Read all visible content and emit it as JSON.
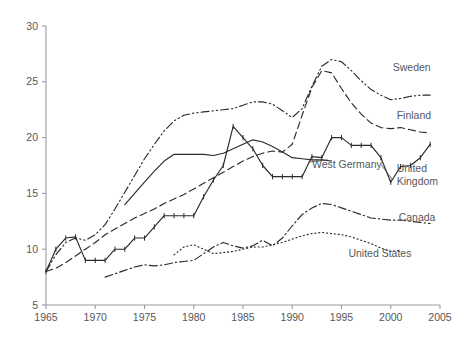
{
  "chart_data": {
    "type": "line",
    "title": "",
    "subtitle": "",
    "xlabel": "",
    "ylabel": "",
    "xlim": [
      1965,
      2005
    ],
    "ylim": [
      5,
      30
    ],
    "xticks": [
      1965,
      1970,
      1975,
      1980,
      1985,
      1990,
      1995,
      2000,
      2005
    ],
    "yticks": [
      5,
      10,
      15,
      20,
      25,
      30
    ],
    "grid": false,
    "legend": "inline-labels",
    "series": [
      {
        "name": "Sweden",
        "style": "dash-dot-dot",
        "marker": "none",
        "label_x": 2000.2,
        "label_y": 26.3,
        "x": [
          1965,
          1966,
          1967,
          1968,
          1969,
          1970,
          1971,
          1972,
          1973,
          1974,
          1975,
          1976,
          1977,
          1978,
          1979,
          1980,
          1981,
          1982,
          1983,
          1984,
          1985,
          1986,
          1987,
          1988,
          1989,
          1990,
          1991,
          1992,
          1993,
          1994,
          1995,
          1996,
          1997,
          1998,
          1999,
          2000,
          2001,
          2002,
          2003,
          2004
        ],
        "y": [
          8.0,
          9.5,
          10.6,
          11.0,
          10.8,
          11.3,
          12.2,
          13.6,
          15.1,
          16.6,
          18.1,
          19.4,
          20.6,
          21.5,
          22.0,
          22.2,
          22.3,
          22.4,
          22.5,
          22.6,
          22.9,
          23.2,
          23.2,
          23.0,
          22.4,
          21.8,
          22.6,
          24.6,
          26.4,
          27.0,
          26.8,
          26.0,
          25.1,
          24.3,
          23.8,
          23.4,
          23.5,
          23.7,
          23.8,
          23.8
        ]
      },
      {
        "name": "Finland",
        "style": "dashed",
        "marker": "none",
        "label_x": 2000.6,
        "label_y": 22.0,
        "x": [
          1965,
          1966,
          1967,
          1968,
          1969,
          1970,
          1971,
          1972,
          1973,
          1974,
          1975,
          1976,
          1977,
          1978,
          1979,
          1980,
          1981,
          1982,
          1983,
          1984,
          1985,
          1986,
          1987,
          1988,
          1989,
          1990,
          1991,
          1992,
          1993,
          1994,
          1995,
          1996,
          1997,
          1998,
          1999,
          2000,
          2001,
          2002,
          2003,
          2004
        ],
        "y": [
          8.0,
          8.3,
          8.8,
          9.4,
          10.0,
          10.6,
          11.3,
          11.8,
          12.3,
          12.8,
          13.2,
          13.6,
          14.1,
          14.5,
          14.9,
          15.4,
          15.9,
          16.4,
          16.9,
          17.4,
          17.9,
          18.3,
          18.6,
          18.8,
          18.7,
          19.4,
          22.0,
          24.5,
          26.0,
          25.8,
          24.4,
          23.1,
          22.1,
          21.3,
          20.9,
          20.8,
          20.9,
          20.7,
          20.5,
          20.4
        ]
      },
      {
        "name": "West Germany",
        "style": "solid",
        "marker": "none",
        "label_x": 1992.0,
        "label_y": 17.6,
        "x": [
          1973,
          1974,
          1975,
          1976,
          1977,
          1978,
          1979,
          1980,
          1981,
          1982,
          1983,
          1984,
          1985,
          1986,
          1987,
          1988,
          1989,
          1990,
          1991,
          1992,
          1993,
          1994
        ],
        "y": [
          14.0,
          15.0,
          16.0,
          17.0,
          17.9,
          18.5,
          18.5,
          18.5,
          18.5,
          18.4,
          18.6,
          19.0,
          19.4,
          19.8,
          19.6,
          19.2,
          18.7,
          18.2,
          18.1,
          18.0,
          18.0,
          17.9
        ]
      },
      {
        "name": "United Kingdom",
        "style": "solid-ticks",
        "marker": "tick",
        "label_x": 2000.6,
        "label_y": 17.3,
        "x": [
          1965,
          1966,
          1967,
          1968,
          1969,
          1970,
          1971,
          1972,
          1973,
          1974,
          1975,
          1976,
          1977,
          1978,
          1979,
          1980,
          1981,
          1982,
          1983,
          1984,
          1985,
          1986,
          1987,
          1988,
          1989,
          1990,
          1991,
          1992,
          1993,
          1994,
          1995,
          1996,
          1997,
          1998,
          1999,
          2000,
          2001,
          2002,
          2003,
          2004
        ],
        "y": [
          8.0,
          10.0,
          11.0,
          11.1,
          9.0,
          9.0,
          9.0,
          10.0,
          10.0,
          11.0,
          11.0,
          12.0,
          13.0,
          13.0,
          13.0,
          13.0,
          14.7,
          16.2,
          17.5,
          21.0,
          20.0,
          19.0,
          17.5,
          16.5,
          16.5,
          16.5,
          16.5,
          18.3,
          18.2,
          20.0,
          20.0,
          19.3,
          19.3,
          19.3,
          18.2,
          16.0,
          17.4,
          17.5,
          18.2,
          19.4
        ]
      },
      {
        "name": "Canada",
        "style": "dash-dot",
        "marker": "none",
        "label_x": 2000.8,
        "label_y": 12.9,
        "x": [
          1971,
          1972,
          1973,
          1974,
          1975,
          1976,
          1977,
          1978,
          1979,
          1980,
          1981,
          1982,
          1983,
          1984,
          1985,
          1986,
          1987,
          1988,
          1989,
          1990,
          1991,
          1992,
          1993,
          1994,
          1995,
          1996,
          1997,
          1998,
          1999,
          2000,
          2001,
          2002,
          2003,
          2004
        ],
        "y": [
          7.5,
          7.8,
          8.1,
          8.4,
          8.6,
          8.5,
          8.6,
          8.8,
          8.9,
          9.0,
          9.6,
          10.2,
          10.6,
          10.3,
          10.1,
          10.3,
          10.8,
          10.3,
          11.0,
          12.1,
          13.1,
          13.7,
          14.1,
          14.0,
          13.7,
          13.4,
          13.1,
          12.8,
          12.7,
          12.6,
          12.6,
          12.5,
          12.4,
          12.3
        ]
      },
      {
        "name": "United States",
        "style": "dotted",
        "marker": "none",
        "label_x": 1995.7,
        "label_y": 9.7,
        "x": [
          1978,
          1979,
          1980,
          1981,
          1982,
          1983,
          1984,
          1985,
          1986,
          1987,
          1988,
          1989,
          1990,
          1991,
          1992,
          1993,
          1994,
          1995,
          1996,
          1997,
          1998,
          1999,
          2000,
          2001
        ],
        "y": [
          9.5,
          10.2,
          10.4,
          10.0,
          9.6,
          9.7,
          9.8,
          10.0,
          10.2,
          10.2,
          10.4,
          10.6,
          10.9,
          11.2,
          11.4,
          11.5,
          11.4,
          11.3,
          11.1,
          10.8,
          10.5,
          10.1,
          9.8,
          9.9
        ]
      }
    ],
    "leader_lines": [
      {
        "name": "west-germany-leader",
        "x1": 1991.6,
        "y1": 17.8,
        "x2": 1993.6,
        "y2": 18.0
      },
      {
        "name": "united-kingdom-leader",
        "x1": 1999.0,
        "y1": 17.6,
        "x2": 2000.2,
        "y2": 16.2
      }
    ]
  }
}
